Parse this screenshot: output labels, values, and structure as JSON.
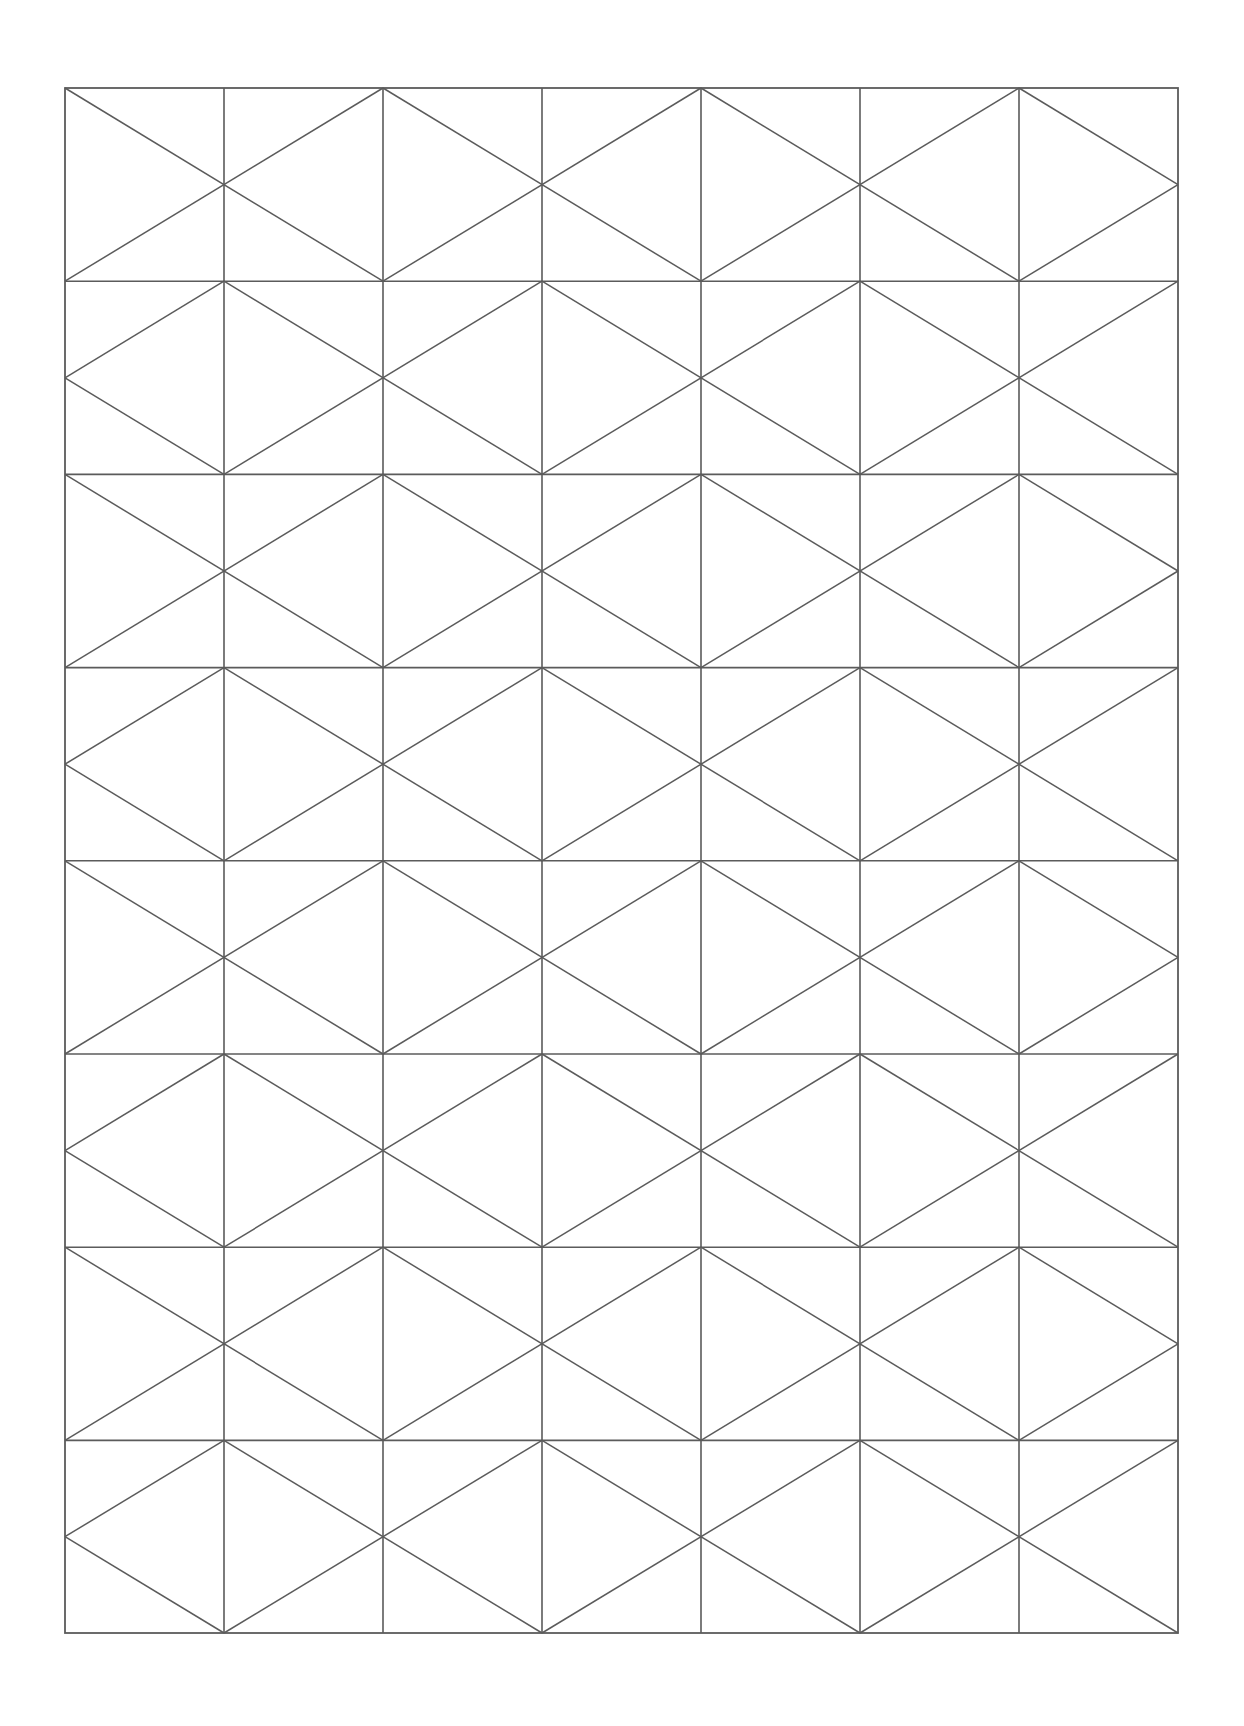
{
  "document": {
    "title": "Geometric Lattice Pattern Sheet",
    "background_color": "#ffffff",
    "canvas_width": 1244,
    "canvas_height": 1726
  },
  "pattern": {
    "name": "diagonal-lattice-grid",
    "description": "Rectangular grid overlaid with diagonals forming nested diamond / chevron lattice",
    "stroke_color": "#5b5b5b",
    "stroke_width": 1.6,
    "fill": "none",
    "bounds": {
      "left": 65,
      "top": 88,
      "right": 1178,
      "bottom": 1633,
      "width": 1113,
      "height": 1545
    },
    "grid": {
      "columns": 7,
      "rows": 16,
      "cell_width": 159,
      "cell_height": 96.6,
      "x_positions": [
        65,
        224,
        383,
        542,
        701,
        860,
        1019,
        1178
      ],
      "y_positions": [
        88,
        184.6,
        281.2,
        377.8,
        474.4,
        571,
        667.6,
        764.2,
        860.8,
        957.4,
        1054,
        1150.6,
        1247.2,
        1343.8,
        1440.4,
        1537,
        1633
      ]
    },
    "visible_vertical_lines_x": [
      65,
      224,
      383,
      542,
      701,
      860,
      1019,
      1178
    ],
    "visible_horizontal_lines_y": [
      88,
      281.2,
      474.4,
      667.6,
      860.8,
      1054,
      1247.2,
      1440.4,
      1633
    ],
    "diamond_node_columns": [
      224,
      542,
      860
    ],
    "diamond_node_rows": [
      281.2,
      474.4,
      667.6,
      860.8,
      1054,
      1247.2,
      1440.4
    ],
    "diagonal_block_width": 318,
    "diagonal_block_height": 193.2,
    "elements": {
      "border_rect": "outer rectangle",
      "vertical_grid_lines": 6,
      "horizontal_grid_lines": 7,
      "diagonal_groups": "alternating left and right leaning diagonals spanning two cells"
    }
  }
}
